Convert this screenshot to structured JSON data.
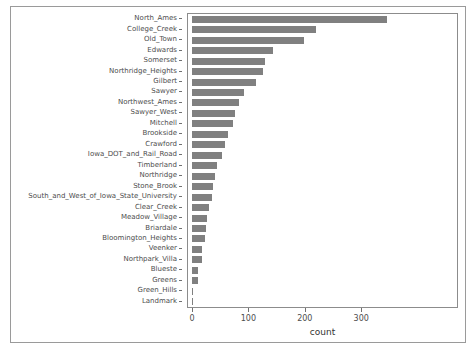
{
  "chart_data": {
    "type": "bar",
    "orientation": "horizontal",
    "title": "",
    "xlabel": "count",
    "ylabel": "",
    "xlim": [
      0,
      360
    ],
    "ylim": null,
    "grid": false,
    "legend": null,
    "bar_color": "#808080",
    "panel_border_color": "#8c8c8c",
    "xticks": [
      0,
      100,
      200,
      300
    ],
    "xticklabels": [
      "0",
      "100",
      "200",
      "300"
    ],
    "categories": [
      "Landmark",
      "Green_Hills",
      "Greens",
      "Blueste",
      "Northpark_Villa",
      "Veenker",
      "Bloomington_Heights",
      "Briardale",
      "Meadow_Village",
      "Clear_Creek",
      "South_and_West_of_Iowa_State_University",
      "Stone_Brook",
      "Northridge",
      "Timberland",
      "Iowa_DOT_and_Rail_Road",
      "Crawford",
      "Brookside",
      "Mitchell",
      "Sawyer_West",
      "Northwest_Ames",
      "Sawyer",
      "Gilbert",
      "Northridge_Heights",
      "Somerset",
      "Edwards",
      "Old_Town",
      "College_Creek",
      "North_Ames"
    ],
    "values": [
      1,
      2,
      11,
      11,
      18,
      18,
      23,
      25,
      26,
      31,
      36,
      37,
      41,
      44,
      54,
      59,
      64,
      73,
      77,
      83,
      93,
      113,
      125,
      130,
      143,
      198,
      219,
      345
    ]
  },
  "axis": {
    "x_title": "count"
  }
}
